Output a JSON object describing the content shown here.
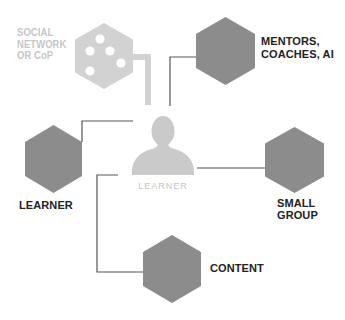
{
  "diagram": {
    "center": {
      "label": "LEARNER",
      "icon": "person-icon"
    },
    "nodes": [
      {
        "id": "social-network",
        "lines": [
          "SOCIAL",
          "NETWORK",
          "OR CoP"
        ],
        "style": "light",
        "icon": "network-dots-icon"
      },
      {
        "id": "mentors",
        "lines": [
          "MENTORS,",
          "COACHES, AI"
        ],
        "style": "dark"
      },
      {
        "id": "learner",
        "lines": [
          "LEARNER"
        ],
        "style": "dark"
      },
      {
        "id": "small-group",
        "lines": [
          "SMALL",
          "GROUP"
        ],
        "style": "dark"
      },
      {
        "id": "content",
        "lines": [
          "CONTENT"
        ],
        "style": "dark"
      }
    ],
    "colors": {
      "hex_dark": "#8c8c8c",
      "hex_light": "#d2d2d2",
      "person": "#cacaca",
      "connector": "#555555",
      "label_dark": "#222222",
      "label_light": "#c6c6c6"
    }
  }
}
